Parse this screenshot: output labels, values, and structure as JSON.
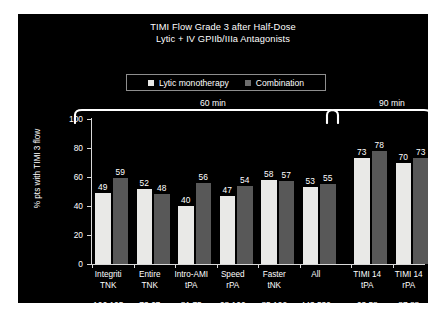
{
  "chart_data": {
    "type": "bar",
    "title": "TIMI Flow Grade 3 after Half-Dose Lytic + IV GPIIb/IIIa Antagonists",
    "title_line1": "TIMI Flow Grade 3 after Half-Dose",
    "title_line2": "Lytic + IV GPIIb/IIIa Antagonists",
    "xlabel": "",
    "ylabel": "% pts with TIMI 3 flow",
    "ylim": [
      0,
      100
    ],
    "yticks": [
      0,
      20,
      40,
      60,
      80,
      100
    ],
    "ytick_labels": [
      "0",
      "20",
      "40",
      "60",
      "80",
      "100"
    ],
    "grid": false,
    "legend_position": "top-center",
    "categories": [
      {
        "line1": "Integriti",
        "line2": "TNK"
      },
      {
        "line1": "Entire",
        "line2": "TNK"
      },
      {
        "line1": "Intro-AMI",
        "line2": "tPA"
      },
      {
        "line1": "Speed",
        "line2": "rPA"
      },
      {
        "line1": "Faster",
        "line2": "tNK"
      },
      {
        "line1": "All",
        "line2": ""
      },
      {
        "line1": "TIMI 14",
        "line2": "tPA"
      },
      {
        "line1": "TIMI 14",
        "line2": "rPA"
      }
    ],
    "series": [
      {
        "name": "Lytic monotherapy",
        "color": "#e9e9e7",
        "values": [
          49,
          52,
          40,
          47,
          58,
          53,
          73,
          70
        ]
      },
      {
        "name": "Combination",
        "color": "#585858",
        "values": [
          59,
          48,
          56,
          54,
          57,
          55,
          78,
          73
        ]
      }
    ],
    "n_counts": [
      {
        "mono": "106",
        "combo": "105"
      },
      {
        "mono": "73",
        "combo": "67"
      },
      {
        "mono": "81",
        "combo": "75"
      },
      {
        "mono": "98",
        "combo": "100"
      },
      {
        "mono": "85",
        "combo": "192"
      },
      {
        "mono": "443",
        "combo": "539"
      },
      {
        "mono": "63",
        "combo": "58"
      },
      {
        "mono": "87",
        "combo": "88"
      }
    ],
    "group_annotations": [
      {
        "label": "60 min",
        "categories": [
          0,
          1,
          2,
          3,
          4,
          5
        ]
      },
      {
        "label": "90 min",
        "categories": [
          6,
          7
        ]
      }
    ]
  },
  "legend": {
    "items": [
      {
        "label": "Lytic monotherapy",
        "swatch": "light"
      },
      {
        "label": "Combination",
        "swatch": "dark"
      }
    ]
  },
  "colors": {
    "panel_background": "#000000",
    "page_background": "#ffffff",
    "text": "#ffffff",
    "axis": "#d9d9d9",
    "series_mono": "#e9e9e7",
    "series_combo": "#585858"
  }
}
